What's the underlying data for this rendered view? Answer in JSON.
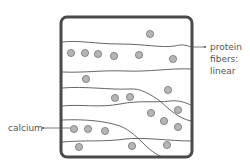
{
  "diagram": {
    "labels": {
      "protein": [
        "protein",
        "fibers:",
        "linear"
      ],
      "calcium": "calcium"
    },
    "colors": {
      "box_border": "#4a4a4a",
      "fiber": "#555555",
      "particle_fill": "#b5b5b5",
      "particle_stroke": "#6a6a6a",
      "label_text": "#555555"
    },
    "box": {
      "x": 61,
      "y": 17,
      "width": 131,
      "height": 140,
      "radius": 6
    },
    "fibers": [
      "M62,42 C80,40 95,44 120,44 C145,44 160,48 175,46 C182,44 186,45 191,47",
      "M62,72 C85,73 100,70 125,71 C150,72 170,68 191,69",
      "M62,88 C85,86 110,90 130,89 C140,88 150,94 160,101 C170,110 178,118 191,121",
      "M62,106 C80,104 100,108 120,104 C140,100 155,103 170,101 C180,100 186,103 191,105",
      "M62,120 C85,119 105,121 120,126 C130,130 138,138 146,146 C152,152 158,155 162,157",
      "M62,142 C85,140 105,142 125,139 C145,137 170,141 191,141"
    ],
    "particles": [
      {
        "x": 150,
        "y": 34
      },
      {
        "x": 71,
        "y": 53
      },
      {
        "x": 85,
        "y": 53
      },
      {
        "x": 98,
        "y": 54
      },
      {
        "x": 114,
        "y": 56
      },
      {
        "x": 139,
        "y": 55
      },
      {
        "x": 173,
        "y": 59
      },
      {
        "x": 86,
        "y": 79
      },
      {
        "x": 168,
        "y": 90
      },
      {
        "x": 115,
        "y": 98
      },
      {
        "x": 130,
        "y": 97
      },
      {
        "x": 151,
        "y": 113
      },
      {
        "x": 178,
        "y": 110
      },
      {
        "x": 164,
        "y": 121
      },
      {
        "x": 178,
        "y": 127
      },
      {
        "x": 74,
        "y": 129
      },
      {
        "x": 88,
        "y": 129
      },
      {
        "x": 105,
        "y": 131
      },
      {
        "x": 79,
        "y": 147
      },
      {
        "x": 132,
        "y": 146
      },
      {
        "x": 167,
        "y": 145
      }
    ],
    "leaders": {
      "protein": {
        "x1": 191,
        "y1": 47,
        "x2": 205,
        "y2": 47
      },
      "calcium": {
        "x1": 43,
        "y1": 128,
        "x2": 70,
        "y2": 128
      }
    }
  }
}
